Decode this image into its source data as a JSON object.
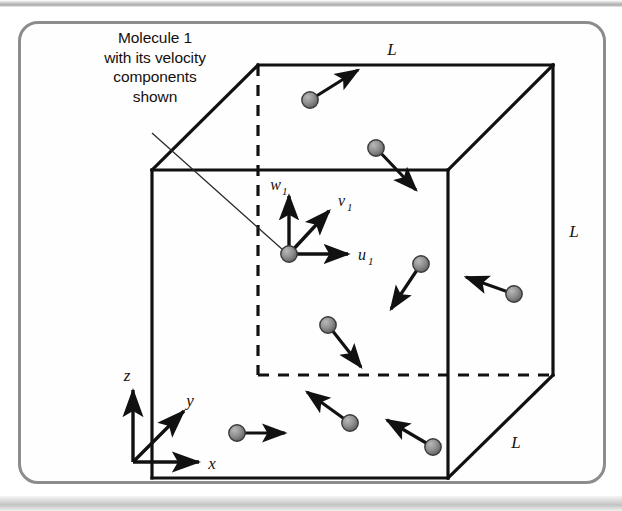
{
  "figure": {
    "caption_lines": [
      "Molecule 1",
      "with its velocity",
      "components",
      "shown"
    ],
    "caption_text": "Molecule 1 with its velocity components shown",
    "frame_color": "#8c8c8c",
    "background_color": "#fefefe"
  },
  "cube": {
    "edge_labels": [
      {
        "id": "top",
        "text": "L"
      },
      {
        "id": "right",
        "text": "L"
      },
      {
        "id": "bottom-right",
        "text": "L"
      }
    ],
    "line_color": "#111111",
    "hidden_edge_style": "dashed"
  },
  "axes": {
    "z": "z",
    "y": "y",
    "x": "x"
  },
  "velocity_components": {
    "w": "w",
    "w_sub": "1",
    "v": "v",
    "v_sub": "1",
    "u": "u",
    "u_sub": "1"
  },
  "molecules": [
    {
      "id": 1,
      "label": "molecule-1",
      "x": 289,
      "y": 254,
      "vx": 0,
      "vy": 0,
      "highlighted": true
    },
    {
      "id": 2,
      "label": "molecule-top-left",
      "x": 310,
      "y": 100,
      "vx": 48,
      "vy": -30
    },
    {
      "id": 3,
      "label": "molecule-top-right",
      "x": 376,
      "y": 148,
      "vx": 40,
      "vy": 42
    },
    {
      "id": 4,
      "label": "molecule-mid-right",
      "x": 421,
      "y": 264,
      "vx": -30,
      "vy": 45
    },
    {
      "id": 5,
      "label": "molecule-right-edge",
      "x": 514,
      "y": 294,
      "vx": -48,
      "vy": -17
    },
    {
      "id": 6,
      "label": "molecule-center-low",
      "x": 328,
      "y": 325,
      "vx": 33,
      "vy": 42
    },
    {
      "id": 7,
      "label": "molecule-bottom-left",
      "x": 237,
      "y": 433,
      "vx": 48,
      "vy": 0
    },
    {
      "id": 8,
      "label": "molecule-bottom-mid",
      "x": 350,
      "y": 423,
      "vx": -43,
      "vy": -31
    },
    {
      "id": 9,
      "label": "molecule-bottom-right",
      "x": 433,
      "y": 447,
      "vx": -46,
      "vy": -27
    }
  ],
  "colors": {
    "molecule_fill": "#8e8e8e",
    "molecule_stroke": "#3a3a3a",
    "arrow": "#111111"
  }
}
